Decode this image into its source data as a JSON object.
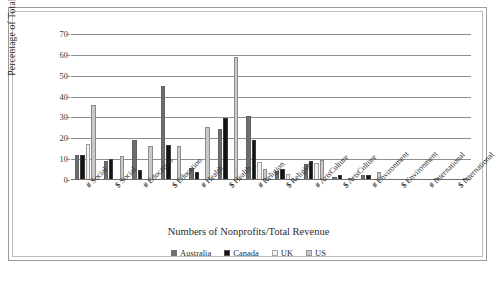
{
  "chart_data": {
    "type": "bar",
    "title": "",
    "xlabel": "Numbers of Nonprofits/Total Revenue",
    "ylabel": "Percentage of Total",
    "ylim": [
      0,
      70
    ],
    "yticks": [
      0,
      10,
      20,
      30,
      40,
      50,
      60,
      70
    ],
    "grid": true,
    "legend_position": "bottom",
    "categories": [
      "# Social",
      "$ Social",
      "# Education",
      "$ Education",
      "# Health",
      "$ Health",
      "# Religion",
      "$ Religion",
      "# ArtsCulture",
      "$ ArtsCulture",
      "# Environment",
      "$ Environment",
      "# International",
      "$ International"
    ],
    "category_prefixes": [
      "#",
      "$",
      "#",
      "$",
      "#",
      "$",
      "#",
      "$",
      "#",
      "$",
      "#",
      "$",
      "#",
      "$"
    ],
    "category_names": [
      "Social",
      "Social",
      "Education",
      "Education",
      "Health",
      "Health",
      "Religion",
      "Religion",
      "ArtsCulture",
      "ArtsCulture",
      "Environment",
      "Environment",
      "International",
      "International"
    ],
    "series": [
      {
        "name": "Australia",
        "color": "#6e6e6e",
        "values": [
          12,
          9,
          19,
          45,
          6,
          24.5,
          30.5,
          4.5,
          7.5,
          1.5,
          2.5,
          0.5,
          0.5,
          0.5
        ]
      },
      {
        "name": "Canada",
        "color": "#141414",
        "values": [
          12,
          10,
          5,
          17,
          4,
          29.5,
          19,
          5.5,
          9,
          2.5,
          2.5,
          0.5,
          0.5,
          0.5
        ]
      },
      {
        "name": "UK",
        "color": "#f2f2f2",
        "values": [
          17.5,
          0,
          0,
          0,
          0,
          0,
          8.5,
          3,
          8,
          0,
          0,
          0,
          0,
          0
        ]
      },
      {
        "name": "US",
        "color": "#c9c9c9",
        "values": [
          36,
          11.5,
          16.5,
          16.5,
          25.5,
          59,
          5.5,
          0.5,
          9.5,
          1,
          4,
          0.5,
          1,
          1
        ]
      }
    ]
  },
  "legend": {
    "items": [
      {
        "label": "Australia",
        "color": "#6e6e6e"
      },
      {
        "label": "Canada",
        "color": "#141414"
      },
      {
        "label": "UK",
        "color": "#f2f2f2"
      },
      {
        "label": "US",
        "color": "#c9c9c9"
      }
    ]
  },
  "axes": {
    "y_title": "Percentage of Total",
    "x_title": "Numbers of Nonprofits/Total Revenue",
    "y_tick_labels": [
      "70",
      "60",
      "50",
      "40",
      "30",
      "20",
      "10",
      "0"
    ]
  }
}
